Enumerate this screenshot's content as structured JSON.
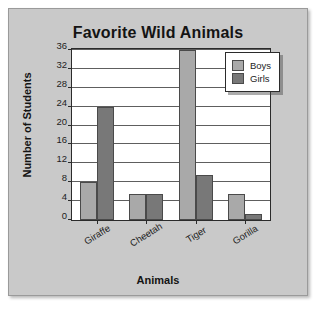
{
  "chart_data": {
    "type": "bar",
    "title": "Favorite Wild Animals",
    "xlabel": "Animals",
    "ylabel": "Number of Students",
    "categories": [
      "Giraffe",
      "Cheetah",
      "Tiger",
      "Gorilla"
    ],
    "series": [
      {
        "name": "Boys",
        "color": "#a9a9a9",
        "values": [
          8,
          5.5,
          36,
          5.5
        ]
      },
      {
        "name": "Girls",
        "color": "#787878",
        "values": [
          24,
          5.5,
          9.5,
          1.2
        ]
      }
    ],
    "ylim": [
      0,
      36
    ],
    "ytick_step": 4,
    "yticks": [
      0,
      4,
      8,
      12,
      16,
      20,
      24,
      28,
      32,
      36
    ],
    "grid": true,
    "legend_position": "top-right",
    "background_color": "#c9c9c9",
    "plot_background_color": "#ffffff",
    "axis_color": "#2b2b2b"
  }
}
